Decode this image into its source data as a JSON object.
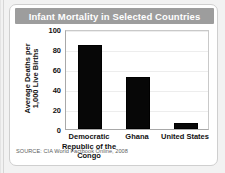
{
  "card": {
    "title": "Infant Mortality in Selected Countries",
    "source": "SOURCE: CIA World Factbook Online, 2008",
    "title_band_color": "#9d9d9d",
    "bar_color": "#070707"
  },
  "chart_data": {
    "type": "bar",
    "title": "Infant Mortality in Selected Countries",
    "categories": [
      "Democratic Republic of the Congo",
      "Ghana",
      "United States"
    ],
    "values": [
      84,
      52,
      6
    ],
    "xlabel": "",
    "ylabel": "Average Deaths per 1,000 Live Births",
    "ylabel_line1": "Average Deaths per",
    "ylabel_line2": "1,000 Live Births",
    "ylim": [
      0,
      100
    ],
    "yticks": [
      0,
      20,
      40,
      60,
      80,
      100
    ],
    "ytick_labels": [
      "0",
      "20",
      "40",
      "60",
      "80",
      "100"
    ],
    "grid": true,
    "legend": false,
    "source": "SOURCE: CIA World Factbook Online, 2008"
  }
}
